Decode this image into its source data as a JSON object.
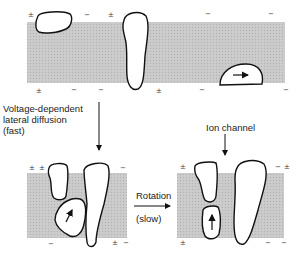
{
  "diagram": {
    "labels": {
      "diffusion_line1": "Voltage-dependent",
      "diffusion_line2": "lateral diffusion",
      "diffusion_line3": "(fast)",
      "rotation": "Rotation",
      "rotation_speed": "(slow)",
      "ion_channel": "Ion channel"
    },
    "colors": {
      "membrane": "#c4c4c4",
      "protein_fill": "#ffffff",
      "outline": "#111111"
    },
    "panels": [
      {
        "name": "top-membrane",
        "state": "dispersed proteins"
      },
      {
        "name": "bottom-left-membrane",
        "state": "aggregated after lateral diffusion"
      },
      {
        "name": "bottom-right-membrane",
        "state": "rotated subunits forming ion channel"
      }
    ],
    "charge_symbols": {
      "plus_minus": "±",
      "minus": "−"
    }
  }
}
